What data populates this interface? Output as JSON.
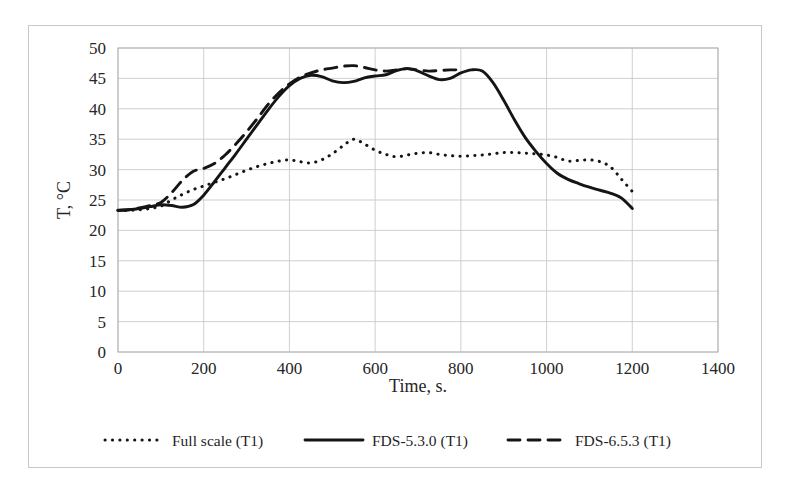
{
  "figure": {
    "background_color": "#ffffff",
    "border_color": "#c8c8c8",
    "ink_color": "#151515",
    "grid_color": "#c9c9c9"
  },
  "chart_data": {
    "type": "line",
    "title": "",
    "xlabel": "Time, s.",
    "ylabel": "T, °C",
    "xlim": [
      0,
      1400
    ],
    "ylim": [
      0,
      50
    ],
    "xticks": [
      0,
      200,
      400,
      600,
      800,
      1000,
      1200,
      1400
    ],
    "yticks": [
      0,
      5,
      10,
      15,
      20,
      25,
      30,
      35,
      40,
      45,
      50
    ],
    "xtick_labels": [
      "0",
      "200",
      "400",
      "600",
      "800",
      "1000",
      "1200",
      "1400"
    ],
    "ytick_labels": [
      "0",
      "5",
      "10",
      "15",
      "20",
      "25",
      "30",
      "35",
      "40",
      "45",
      "50"
    ],
    "grid": true,
    "grid_axis": "y-and-x",
    "legend_position": "below-plot",
    "series": [
      {
        "name": "Full scale (T1)",
        "style": "dotted",
        "color": "#151515",
        "x": [
          0,
          25,
          50,
          75,
          100,
          125,
          150,
          175,
          200,
          225,
          250,
          275,
          300,
          325,
          350,
          375,
          400,
          425,
          450,
          475,
          500,
          525,
          550,
          575,
          600,
          625,
          650,
          675,
          700,
          725,
          750,
          775,
          800,
          825,
          850,
          875,
          900,
          925,
          950,
          975,
          1000,
          1025,
          1050,
          1075,
          1100,
          1125,
          1150,
          1175,
          1200
        ],
        "y": [
          23.3,
          23.3,
          23.4,
          23.6,
          24.0,
          25.0,
          25.9,
          26.7,
          27.3,
          27.9,
          28.5,
          29.2,
          29.9,
          30.5,
          31.0,
          31.4,
          31.6,
          31.3,
          31.1,
          31.6,
          32.6,
          33.9,
          35.0,
          34.2,
          33.2,
          32.5,
          32.1,
          32.4,
          32.7,
          32.8,
          32.5,
          32.3,
          32.2,
          32.3,
          32.4,
          32.6,
          32.8,
          32.8,
          32.7,
          32.6,
          32.4,
          32.0,
          31.4,
          31.5,
          31.6,
          31.3,
          30.4,
          28.4,
          26.4
        ]
      },
      {
        "name": "FDS-5.3.0 (T1)",
        "style": "solid",
        "color": "#151515",
        "x": [
          0,
          25,
          50,
          75,
          100,
          125,
          150,
          175,
          200,
          225,
          250,
          275,
          300,
          325,
          350,
          375,
          400,
          425,
          450,
          475,
          500,
          525,
          550,
          575,
          600,
          625,
          650,
          675,
          700,
          725,
          750,
          775,
          800,
          825,
          850,
          875,
          900,
          925,
          950,
          975,
          1000,
          1025,
          1050,
          1075,
          1100,
          1125,
          1150,
          1175,
          1200
        ],
        "y": [
          23.3,
          23.4,
          23.6,
          23.9,
          24.2,
          24.1,
          23.8,
          24.2,
          25.8,
          28.0,
          30.3,
          32.6,
          35.0,
          37.4,
          39.8,
          42.0,
          43.8,
          45.0,
          45.5,
          45.3,
          44.6,
          44.3,
          44.5,
          45.1,
          45.4,
          45.6,
          46.3,
          46.6,
          46.2,
          45.4,
          44.8,
          45.0,
          45.9,
          46.4,
          46.2,
          44.3,
          41.4,
          38.2,
          35.3,
          33.0,
          31.0,
          29.4,
          28.4,
          27.7,
          27.1,
          26.6,
          26.1,
          25.3,
          23.6
        ]
      },
      {
        "name": "FDS-6.5.3 (T1)",
        "style": "dashed",
        "color": "#151515",
        "x": [
          0,
          25,
          50,
          75,
          100,
          125,
          150,
          175,
          200,
          225,
          250,
          275,
          300,
          325,
          350,
          375,
          400,
          425,
          450,
          475,
          500,
          525,
          550,
          575,
          600,
          625,
          650,
          675,
          700,
          725,
          750,
          775,
          800
        ],
        "y": [
          23.3,
          23.4,
          23.7,
          24.1,
          24.6,
          26.2,
          28.2,
          29.7,
          30.2,
          31.0,
          32.4,
          34.2,
          36.2,
          38.4,
          40.7,
          42.6,
          44.1,
          45.2,
          45.9,
          46.4,
          46.7,
          47.0,
          47.1,
          46.8,
          46.4,
          46.2,
          46.4,
          46.6,
          46.4,
          46.2,
          46.3,
          46.4,
          46.4
        ]
      }
    ]
  },
  "legend": {
    "items": [
      {
        "label": "Full scale (T1)",
        "style": "dotted"
      },
      {
        "label": "FDS-5.3.0 (T1)",
        "style": "solid"
      },
      {
        "label": "FDS-6.5.3 (T1)",
        "style": "dashed"
      }
    ]
  }
}
